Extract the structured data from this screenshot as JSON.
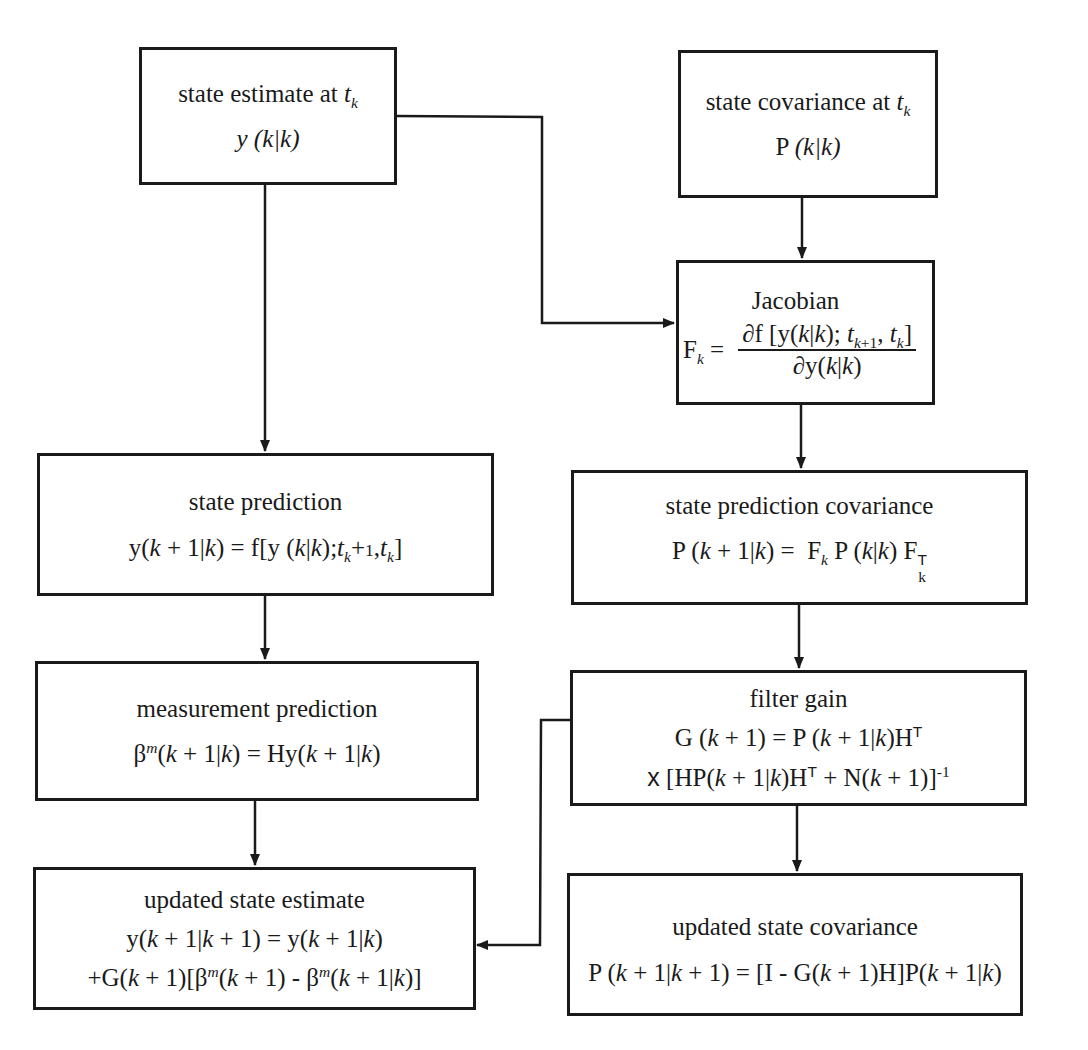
{
  "diagram": {
    "type": "flowchart",
    "boxes": {
      "state_estimate": {
        "title": "state estimate at",
        "title_var": "t",
        "title_sub": "k",
        "equation": "y (k|k)"
      },
      "state_covariance": {
        "title": "state covariance at",
        "title_var": "t",
        "title_sub": "k",
        "equation_prefix": "P",
        "equation": "(k|k)"
      },
      "jacobian": {
        "title": "Jacobian",
        "lhs": "F",
        "lhs_sub": "k",
        "equals": "=",
        "numerator": "∂f [y(k|k); t_{k+1}, t_k]",
        "denominator": "∂y(k|k)"
      },
      "state_prediction": {
        "title": "state prediction",
        "equation": "y(k + 1|k) = f[y (k|k);t_k+1,t_k]"
      },
      "state_prediction_covariance": {
        "title": "state prediction covariance",
        "equation": "P (k + 1|k) =  F_k P (k|k) F_k^T"
      },
      "measurement_prediction": {
        "title": "measurement prediction",
        "equation": "β^m(k + 1|k) = Hy(k + 1|k)"
      },
      "filter_gain": {
        "title": "filter gain",
        "equation_line1": "G (k + 1) = P (k + 1|k)H^T",
        "equation_line2": "x [HP(k + 1|k)H^T + N(k + 1)]^-1"
      },
      "updated_state_estimate": {
        "title": "updated state estimate",
        "equation_line1": "y(k + 1|k + 1) = y(k + 1|k)",
        "equation_line2": "+G(k + 1)[β^m(k + 1) - β^m(k + 1|k)]"
      },
      "updated_state_covariance": {
        "title": "updated state covariance",
        "equation": "P (k + 1|k + 1) = [I - G(k + 1)H]P(k + 1|k)"
      }
    },
    "edges": [
      {
        "from": "state_estimate",
        "to": "jacobian"
      },
      {
        "from": "state_estimate",
        "to": "state_prediction"
      },
      {
        "from": "state_covariance",
        "to": "jacobian"
      },
      {
        "from": "jacobian",
        "to": "state_prediction_covariance"
      },
      {
        "from": "state_prediction",
        "to": "measurement_prediction"
      },
      {
        "from": "state_prediction_covariance",
        "to": "filter_gain"
      },
      {
        "from": "measurement_prediction",
        "to": "updated_state_estimate"
      },
      {
        "from": "filter_gain",
        "to": "updated_state_estimate"
      },
      {
        "from": "filter_gain",
        "to": "updated_state_covariance"
      }
    ],
    "colors": {
      "line": "#1a1a1a",
      "background": "#ffffff"
    }
  }
}
